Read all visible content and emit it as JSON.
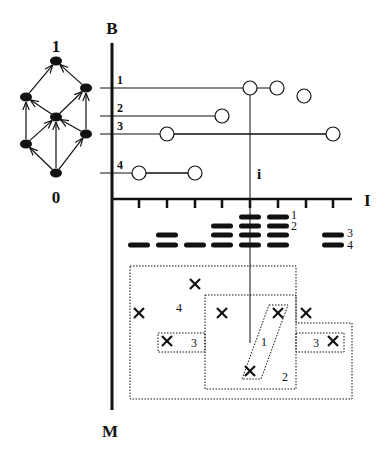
{
  "figure": {
    "width": 388,
    "height": 455,
    "ink_color": "#111111"
  },
  "lattice": {
    "top_label": "1",
    "bottom_label": "0",
    "top_label_pos": [
      56,
      52
    ],
    "bottom_label_pos": [
      56,
      203
    ],
    "nodes": [
      {
        "id": "top",
        "x": 56,
        "y": 61
      },
      {
        "id": "upper-left",
        "x": 26,
        "y": 97
      },
      {
        "id": "upper-right",
        "x": 86,
        "y": 88
      },
      {
        "id": "middle",
        "x": 56,
        "y": 117
      },
      {
        "id": "lower-right",
        "x": 86,
        "y": 134
      },
      {
        "id": "lower-left",
        "x": 26,
        "y": 144
      },
      {
        "id": "bottom",
        "x": 56,
        "y": 173
      }
    ],
    "edges": [
      [
        "bottom",
        "lower-left"
      ],
      [
        "bottom",
        "middle"
      ],
      [
        "bottom",
        "lower-right"
      ],
      [
        "lower-left",
        "upper-left"
      ],
      [
        "lower-left",
        "middle"
      ],
      [
        "lower-right",
        "middle"
      ],
      [
        "lower-right",
        "upper-right"
      ],
      [
        "middle",
        "upper-left"
      ],
      [
        "middle",
        "upper-right"
      ],
      [
        "upper-left",
        "top"
      ],
      [
        "upper-right",
        "top"
      ]
    ]
  },
  "axes": {
    "origin": [
      112,
      199
    ],
    "b_label": "B",
    "b_label_pos": [
      112,
      34
    ],
    "b_axis_top": 43,
    "i_label": "I",
    "i_label_pos": [
      364,
      206
    ],
    "i_axis_right": 352,
    "m_label": "M",
    "m_label_pos": [
      110,
      437
    ],
    "m_axis_bottom": 410,
    "tick_xs": [
      139,
      167,
      195,
      222,
      250,
      278,
      306,
      333
    ],
    "tick_len": 9
  },
  "b_rows": [
    {
      "label": "1",
      "y": 88,
      "line_end": 250,
      "circles": [
        [
          250,
          88
        ],
        [
          277,
          88
        ],
        [
          304,
          96
        ]
      ]
    },
    {
      "label": "2",
      "y": 116,
      "line_end": 222,
      "circles": [
        [
          222,
          116
        ]
      ]
    },
    {
      "label": "3",
      "y": 134,
      "line_end": 333,
      "circles": [
        [
          167,
          134
        ],
        [
          333,
          134
        ]
      ]
    },
    {
      "label": "4",
      "y": 173,
      "line_end": 195,
      "circles": [
        [
          139,
          173
        ],
        [
          195,
          173
        ]
      ]
    }
  ],
  "circle_radius": 7,
  "focus": {
    "label": "i",
    "label_pos": [
      257,
      179
    ],
    "x": 250,
    "top_y": 88,
    "bottom_y": 343
  },
  "bars": {
    "width": 22,
    "height": 5,
    "rows": [
      {
        "y": 217,
        "xs": [
          250,
          278
        ]
      },
      {
        "y": 226,
        "xs": [
          222,
          250,
          278
        ]
      },
      {
        "y": 235,
        "xs": [
          167,
          222,
          250,
          278,
          333
        ]
      },
      {
        "y": 245,
        "xs": [
          139,
          167,
          195,
          222,
          250,
          278,
          333
        ]
      }
    ],
    "labels": [
      {
        "text": "1",
        "x": 291,
        "y": 219
      },
      {
        "text": "2",
        "x": 291,
        "y": 230
      },
      {
        "text": "3",
        "x": 347,
        "y": 237
      },
      {
        "text": "4",
        "x": 347,
        "y": 249
      }
    ]
  },
  "regions": [
    {
      "name": "region-4-outer",
      "points": "130,266 296,266 296,323 352,323 352,399 130,399"
    },
    {
      "name": "region-2-middle",
      "points": "205,295 296,295 296,389 205,389"
    },
    {
      "name": "region-3-left",
      "points": "158,333 205,333 205,352 158,352"
    },
    {
      "name": "region-3-right",
      "points": "296,333 344,333 344,352 296,352"
    },
    {
      "name": "region-1-slanted",
      "points": "269,305 288,305 261,379 242,379"
    }
  ],
  "region_labels": [
    {
      "text": "4",
      "x": 176,
      "y": 312
    },
    {
      "text": "3",
      "x": 191,
      "y": 347
    },
    {
      "text": "1",
      "x": 261,
      "y": 346
    },
    {
      "text": "2",
      "x": 282,
      "y": 381
    },
    {
      "text": "3",
      "x": 313,
      "y": 347
    },
    {
      "text": "3 ",
      "x": 0,
      "y": 0
    }
  ],
  "crosses": [
    [
      195,
      284
    ],
    [
      139,
      313
    ],
    [
      222,
      313
    ],
    [
      278,
      313
    ],
    [
      306,
      313
    ],
    [
      167,
      341
    ],
    [
      333,
      341
    ],
    [
      250,
      371
    ]
  ],
  "cross_size": 5
}
